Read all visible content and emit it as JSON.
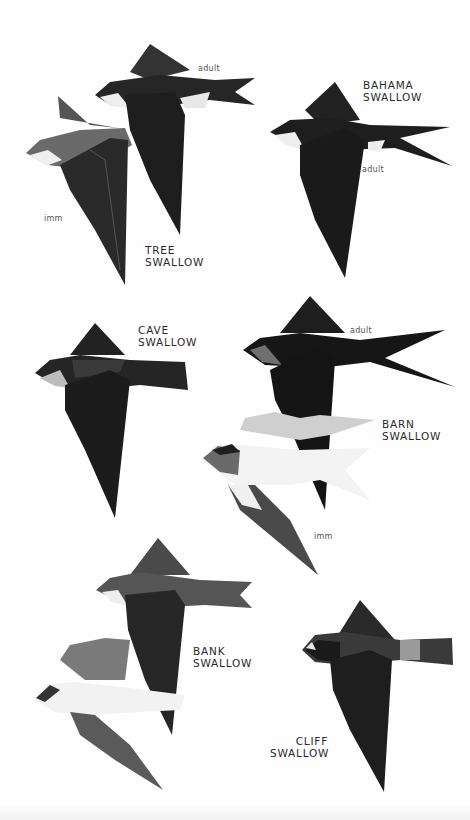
{
  "plate": {
    "species": [
      {
        "name_line1": "TREE",
        "name_line2": "SWALLOW",
        "ages": [
          "adult",
          "imm"
        ]
      },
      {
        "name_line1": "BAHAMA",
        "name_line2": "SWALLOW",
        "ages": [
          "adult"
        ]
      },
      {
        "name_line1": "CAVE",
        "name_line2": "SWALLOW",
        "ages": []
      },
      {
        "name_line1": "BARN",
        "name_line2": "SWALLOW",
        "ages": [
          "adult",
          "imm"
        ]
      },
      {
        "name_line1": "BANK",
        "name_line2": "SWALLOW",
        "ages": []
      },
      {
        "name_line1": "CLIFF",
        "name_line2": "SWALLOW",
        "ages": []
      }
    ]
  },
  "colors": {
    "background": "#fefefe",
    "bird_dark": "#1e1e1e",
    "bird_mid": "#5a5a5a",
    "bird_light": "#f2f2f2",
    "text": "#2a2a2a"
  }
}
